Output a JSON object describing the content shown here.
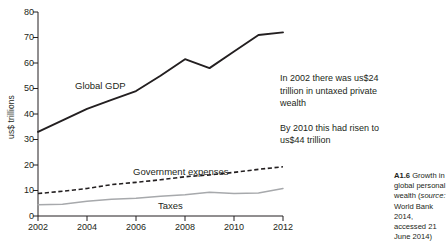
{
  "chart_data": {
    "type": "line",
    "title": "",
    "xlabel": "",
    "ylabel": "us$ trillions",
    "xlim": [
      2002,
      2012
    ],
    "ylim": [
      0,
      80
    ],
    "ytick_values": [
      0,
      10,
      20,
      30,
      40,
      50,
      60,
      70,
      80
    ],
    "ytick_labels": [
      "0",
      "10",
      "20",
      "30",
      "40",
      "50",
      "60",
      "70",
      "80"
    ],
    "xtick_values": [
      2002,
      2004,
      2006,
      2008,
      2010,
      2012
    ],
    "xtick_labels": [
      "2002",
      "2004",
      "2006",
      "2008",
      "2010",
      "2012"
    ],
    "grid": false,
    "legend": "inline-labels",
    "x": [
      2002,
      2003,
      2004,
      2005,
      2006,
      2007,
      2008,
      2009,
      2010,
      2011,
      2012
    ],
    "series": [
      {
        "name": "Global GDP",
        "style": "solid",
        "color": "#231f20",
        "values": [
          33,
          37.5,
          42,
          45.5,
          49,
          55,
          61.5,
          58,
          64.5,
          71,
          72
        ]
      },
      {
        "name": "Government expenses",
        "style": "dashed",
        "color": "#231f20",
        "values": [
          8.8,
          9.7,
          10.8,
          12.3,
          13.2,
          14.2,
          15.4,
          16.1,
          17.1,
          18.3,
          19.3
        ]
      },
      {
        "name": "Taxes",
        "style": "solid",
        "color": "#a7a9ac",
        "values": [
          4.4,
          4.6,
          5.8,
          6.6,
          7.0,
          7.7,
          8.3,
          9.3,
          8.8,
          9.0,
          10.8
        ]
      }
    ]
  },
  "labels": {
    "global_gdp": "Global GDP",
    "government_expenses": "Government expenses",
    "taxes": "Taxes",
    "ylabel": "us$ trillions"
  },
  "annotation": {
    "paragraph_1": "In 2002 there was us$24 trillion in untaxed private wealth",
    "paragraph_2": "By 2010 this had risen to us$44 trillion"
  },
  "caption": {
    "number": "A1.6",
    "text_before_source": " Growth in global personal wealth (",
    "source_word": "source:",
    "text_after_source": " World Bank 2014, accessed 21 June 2014)"
  }
}
